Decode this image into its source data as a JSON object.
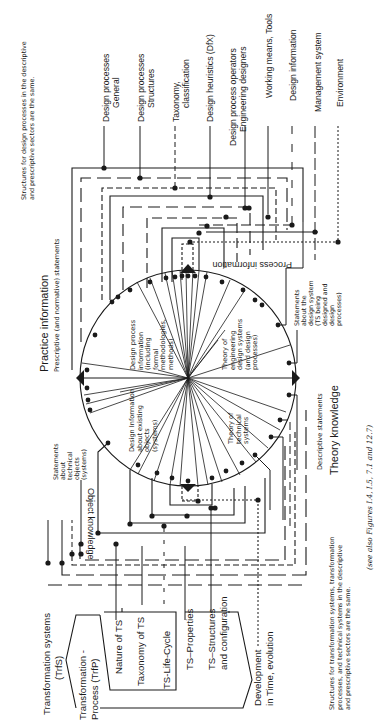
{
  "top_note": {
    "line1": "Structures for design processes in the descriptive",
    "line2": "and prescriptive sectors are the same."
  },
  "bottom_note": {
    "line1": "Structures for transformation systems, transformation",
    "line2": "processes, and technical systems in the descriptive",
    "line3": "and prescriptive sectors are the same."
  },
  "see_also": "(see also Figures I.4, I.5, 7.1 and 12.7)",
  "design_process_categories": [
    {
      "line1": "Design processes",
      "line2": "General"
    },
    {
      "line1": "Design processes",
      "line2": "Structures"
    },
    {
      "line1": "Taxonomy,",
      "line2": "classification"
    },
    {
      "line1": "Design heuristics (DfX)",
      "line2": ""
    },
    {
      "line1": "Design process operators",
      "line2": "Engineering designers"
    },
    {
      "line1": "Working means, Tools",
      "line2": ""
    },
    {
      "line1": "Design information",
      "line2": ""
    },
    {
      "line1": "Management system",
      "line2": ""
    },
    {
      "line1": "Environment",
      "line2": ""
    }
  ],
  "ts_categories": {
    "trfs": {
      "line1": "Transformation systems",
      "line2": "(TrfS)"
    },
    "trfp": {
      "line1": "Transformation -",
      "line2": "Process  (TrfP)"
    },
    "items": [
      {
        "line1": "Nature of TS",
        "line2": ""
      },
      {
        "line1": "Taxonomy of TS",
        "line2": ""
      },
      {
        "line1": "TS-Life-Cycle",
        "line2": ""
      },
      {
        "line1": "TS–Properties",
        "line2": ""
      },
      {
        "line1": "TS–Structures",
        "line2": "and configuration"
      },
      {
        "line1": "Development",
        "line2": "in Time, evolution"
      }
    ]
  },
  "quadrant_labels": {
    "practice": {
      "title": "Practice information",
      "subtitle": "Prescriptive  (and  normative)  statements"
    },
    "theory": {
      "title": "Theory knowledge",
      "subtitle": "Descriptive  statements"
    },
    "process_info": "Process information",
    "object_knowledge": "Object knowledge"
  },
  "sector_labels": {
    "design_process_info": [
      "Design process",
      "information",
      "(including",
      "formal",
      "methodologies,",
      "methods)"
    ],
    "design_info_existing": [
      "Design  Information",
      "about  existing",
      "objects",
      "(systems)"
    ],
    "theory_eng_design": [
      "Theory of",
      "engineering",
      "design  systems",
      "(and  design",
      "processes)"
    ],
    "theory_technical": [
      "Theory of",
      "technical",
      "systems"
    ],
    "statements_design_system": [
      "Statements",
      "about  the",
      "design  system",
      "(TS  being",
      "designed  and",
      "design",
      "processes)"
    ],
    "statements_technical_objects": [
      "Statements",
      "about",
      "technical",
      "objects",
      "(systems)"
    ]
  }
}
